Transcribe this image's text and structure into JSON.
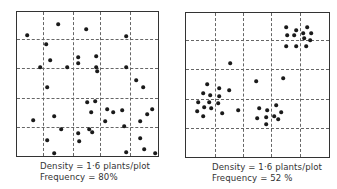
{
  "panels": [
    {
      "id": "random",
      "box": {
        "left": 16,
        "top": 11,
        "width": 143,
        "height": 146
      },
      "grid_x": [
        43,
        73,
        100,
        130
      ],
      "grid_y": [
        39,
        68,
        98,
        127
      ],
      "caption": {
        "density": "Density = 1·6 plants/plot",
        "frequency": "Frequency = 80%",
        "left": 40,
        "top": 161
      },
      "dots": [
        [
          27,
          35
        ],
        [
          58,
          24
        ],
        [
          86,
          29
        ],
        [
          126,
          36
        ],
        [
          46,
          44
        ],
        [
          50,
          60
        ],
        [
          78,
          57
        ],
        [
          78,
          63
        ],
        [
          96,
          56
        ],
        [
          40,
          67
        ],
        [
          67,
          67
        ],
        [
          96,
          67
        ],
        [
          97,
          71
        ],
        [
          126,
          67
        ],
        [
          136,
          80
        ],
        [
          143,
          87
        ],
        [
          47,
          87
        ],
        [
          87,
          102
        ],
        [
          95,
          101
        ],
        [
          91,
          112
        ],
        [
          107,
          109
        ],
        [
          113,
          112
        ],
        [
          122,
          110
        ],
        [
          152,
          109
        ],
        [
          147,
          114
        ],
        [
          54,
          116
        ],
        [
          33,
          120
        ],
        [
          105,
          121
        ],
        [
          140,
          121
        ],
        [
          124,
          126
        ],
        [
          61,
          129
        ],
        [
          89,
          129
        ],
        [
          92,
          132
        ],
        [
          78,
          133
        ],
        [
          47,
          140
        ],
        [
          79,
          141
        ],
        [
          140,
          138
        ],
        [
          144,
          149
        ],
        [
          54,
          153
        ],
        [
          126,
          152
        ],
        [
          155,
          153
        ]
      ]
    },
    {
      "id": "clumped",
      "box": {
        "left": 185,
        "top": 12,
        "width": 145,
        "height": 146
      },
      "grid_x": [
        215,
        243,
        271,
        300
      ],
      "grid_y": [
        40,
        69,
        99,
        128
      ],
      "caption": {
        "density": "Density = 1·6 plants/plot",
        "frequency": "Frequency = 52 %",
        "left": 212,
        "top": 162
      },
      "dots": [
        [
          286,
          27
        ],
        [
          296,
          30
        ],
        [
          307,
          27
        ],
        [
          287,
          35
        ],
        [
          294,
          35
        ],
        [
          303,
          33
        ],
        [
          311,
          33
        ],
        [
          304,
          38
        ],
        [
          310,
          40
        ],
        [
          286,
          46
        ],
        [
          296,
          46
        ],
        [
          306,
          46
        ],
        [
          230,
          63
        ],
        [
          256,
          81
        ],
        [
          283,
          78
        ],
        [
          207,
          84
        ],
        [
          219,
          88
        ],
        [
          229,
          90
        ],
        [
          203,
          93
        ],
        [
          210,
          95
        ],
        [
          219,
          96
        ],
        [
          198,
          102
        ],
        [
          209,
          102
        ],
        [
          218,
          103
        ],
        [
          204,
          107
        ],
        [
          211,
          108
        ],
        [
          197,
          111
        ],
        [
          222,
          113
        ],
        [
          238,
          110
        ],
        [
          203,
          116
        ],
        [
          259,
          108
        ],
        [
          267,
          110
        ],
        [
          276,
          105
        ],
        [
          281,
          112
        ],
        [
          257,
          118
        ],
        [
          266,
          117
        ],
        [
          274,
          116
        ],
        [
          278,
          119
        ],
        [
          266,
          124
        ]
      ]
    }
  ],
  "captions": {
    "left_density": "Density = 1·6 plants/plot",
    "left_frequency": "Frequency = 80%",
    "right_density": "Density = 1·6 plants/plot",
    "right_frequency": "Frequency = 52 %"
  }
}
